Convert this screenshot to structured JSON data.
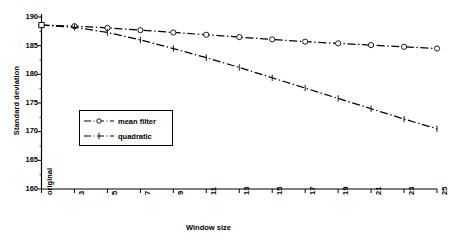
{
  "chart_data": {
    "type": "line",
    "title": "",
    "xlabel": "Window size",
    "ylabel": "Standard deviation",
    "categories": [
      "original",
      "3",
      "5",
      "7",
      "9",
      "11",
      "13",
      "15",
      "17",
      "19",
      "21",
      "23",
      "25"
    ],
    "ylim": [
      160,
      190
    ],
    "yticks": [
      160,
      165,
      170,
      175,
      180,
      185,
      190
    ],
    "grid": false,
    "legend_position": "inside-left",
    "line_style": "dash-dot",
    "series": [
      {
        "name": "mean filter",
        "marker": "open-circle",
        "values": [
          188.6,
          188.4,
          188.1,
          187.7,
          187.3,
          186.9,
          186.5,
          186.1,
          185.7,
          185.4,
          185.1,
          184.8,
          184.5
        ]
      },
      {
        "name": "quadratic",
        "marker": "vertical-tick",
        "values": [
          188.6,
          188.2,
          187.3,
          186.0,
          184.5,
          182.9,
          181.2,
          179.4,
          177.6,
          175.8,
          174.0,
          172.2,
          170.5
        ]
      }
    ],
    "colors": {
      "axis": "#000000",
      "series_mean_filter": "#000000",
      "series_quadratic": "#000000",
      "background": "#ffffff"
    }
  }
}
